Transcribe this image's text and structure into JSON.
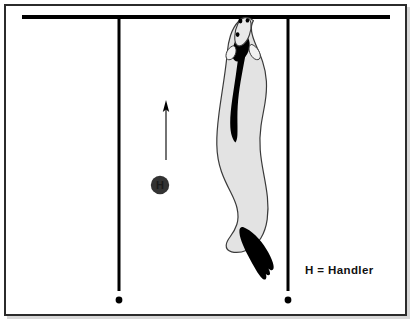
{
  "figure": {
    "background_color": "#ffffff",
    "frame_color": "#2b2b2b"
  },
  "legend": {
    "text": "H  =  Handler",
    "symbol_label": "H",
    "meaning": "Handler"
  },
  "markers": {
    "handler": {
      "label": "H",
      "fill_color": "#333333",
      "x": 160,
      "y": 185,
      "radius": 9
    },
    "start_dot_left": {
      "x": 119,
      "y": 300,
      "radius": 3.2,
      "color": "#000000"
    },
    "start_dot_right": {
      "x": 288,
      "y": 300,
      "radius": 3.2,
      "color": "#000000"
    }
  },
  "lines": {
    "top_bar": {
      "x1": 22,
      "y1": 17,
      "x2": 390,
      "y2": 17,
      "width": 4,
      "color": "#000000"
    },
    "left_vertical": {
      "x1": 119,
      "y1": 17,
      "x2": 119,
      "y2": 292,
      "width": 3,
      "color": "#000000"
    },
    "right_vertical": {
      "x1": 288,
      "y1": 17,
      "x2": 288,
      "y2": 292,
      "width": 3,
      "color": "#000000"
    }
  },
  "direction_arrow": {
    "x": 166,
    "y_tail": 160,
    "y_head": 101,
    "color": "#000000",
    "direction": "up"
  },
  "dog": {
    "body_fill": "#e3e3e3",
    "outline_color": "#3a3a3a",
    "marking_color": "#000000",
    "tail_color": "#000000",
    "orientation": "head-up-facing-away"
  }
}
